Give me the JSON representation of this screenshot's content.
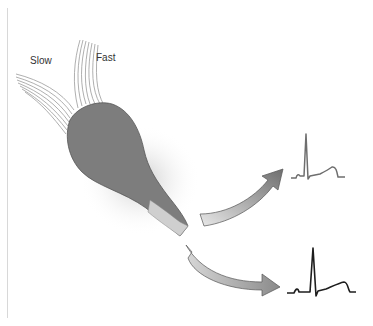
{
  "diagram": {
    "labels": {
      "slow": "Slow",
      "fast": "Fast"
    },
    "elements": [
      {
        "name": "slow-pathway-fibers",
        "description": "fibers entering from upper-left"
      },
      {
        "name": "fast-pathway-fibers",
        "description": "fibers entering from top"
      },
      {
        "name": "av-node",
        "description": "grey bulb-shaped node tapering to a bundle"
      },
      {
        "name": "arrow-upper",
        "description": "curved arrow to top ECG trace"
      },
      {
        "name": "arrow-lower",
        "description": "curved arrow to bottom ECG trace"
      },
      {
        "name": "ecg-trace-upper",
        "description": "grey ECG complex"
      },
      {
        "name": "ecg-trace-lower",
        "description": "black ECG complex"
      }
    ],
    "colors": {
      "node": "#7d7d7d",
      "node_edge": "#555555",
      "arrow_fill_light": "#e6e6e6",
      "arrow_fill_dark": "#7a7a7a",
      "ecg_upper": "#6e6e6e",
      "ecg_lower": "#1e1e1e",
      "fibers": "#9a9a9a"
    }
  }
}
